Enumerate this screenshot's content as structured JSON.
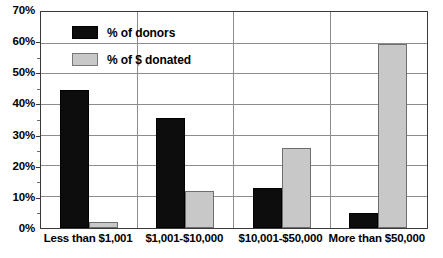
{
  "chart_data": {
    "type": "bar",
    "title": "",
    "subtitle": "",
    "xlabel": "",
    "ylabel": "",
    "categories": [
      "Less than $1,001",
      "$1,001-$10,000",
      "$10,001-$50,000",
      "More than $50,000"
    ],
    "series": [
      {
        "name": "% of donors",
        "color": "#0d0d0d",
        "values": [
          45,
          36,
          13,
          5
        ]
      },
      {
        "name": "% of $ donated",
        "color": "#c8c8c8",
        "values": [
          2,
          12,
          26,
          60
        ]
      }
    ],
    "ylim": [
      0,
      70
    ],
    "ytick_values": [
      0,
      10,
      20,
      30,
      40,
      50,
      60,
      70
    ],
    "ytick_labels": [
      "0%",
      "10%",
      "20%",
      "30%",
      "40%",
      "50%",
      "60%",
      "70%"
    ],
    "grid": true,
    "grid_axis": "y",
    "legend_position": "top-left-inside"
  },
  "legend": {
    "entries": [
      {
        "label": "% of donors",
        "swatch": "black-square-swatch"
      },
      {
        "label": "% of $ donated",
        "swatch": "gray-square-swatch"
      }
    ]
  }
}
